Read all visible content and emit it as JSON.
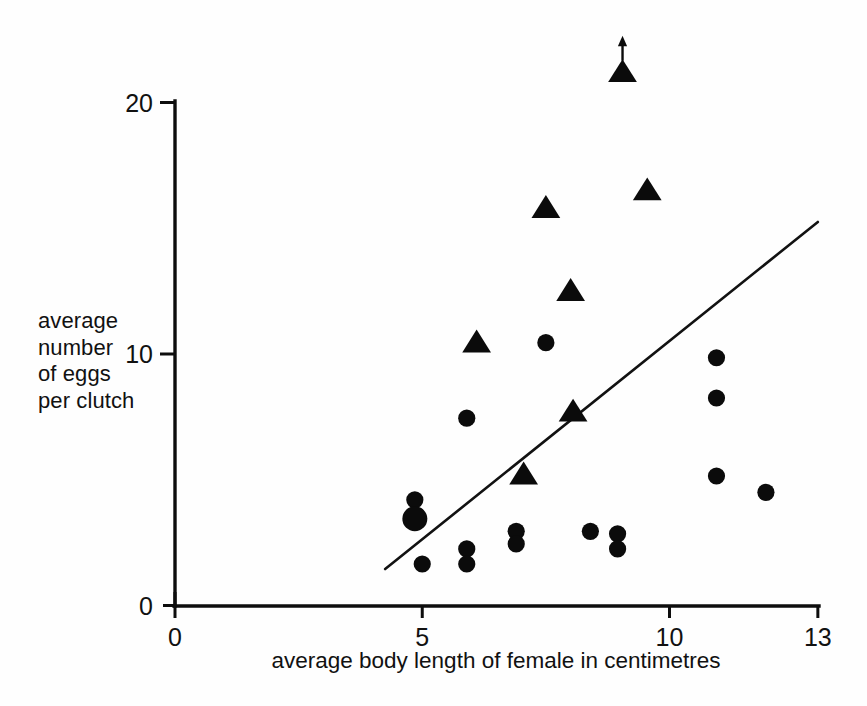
{
  "chart_data": {
    "type": "scatter",
    "title": "",
    "xlabel": "average body length of female in centimetres",
    "ylabel": "average number of eggs per clutch",
    "ylabel_lines": [
      "average",
      "number",
      "of eggs",
      "per clutch"
    ],
    "xlim": [
      0,
      13
    ],
    "ylim": [
      0,
      21.5
    ],
    "xticks": [
      0,
      5,
      10,
      13
    ],
    "xtick_labels": [
      "0",
      "5",
      "10",
      "13"
    ],
    "yticks": [
      0,
      10,
      20
    ],
    "ytick_labels": [
      "0",
      "10",
      "20"
    ],
    "grid": false,
    "legend": "none",
    "annotations": [
      {
        "name": "off-scale-arrow",
        "symbol": "up-arrow",
        "x": 9.05,
        "y": 22.1,
        "note": "upward arrow above highest triangle indicating value extends beyond axis"
      }
    ],
    "series": [
      {
        "name": "triangles",
        "marker": "triangle",
        "color": "#0b0b0b",
        "points": [
          {
            "x": 6.1,
            "y": 10.45
          },
          {
            "x": 7.5,
            "y": 15.8
          },
          {
            "x": 8.0,
            "y": 12.5
          },
          {
            "x": 8.05,
            "y": 7.7
          },
          {
            "x": 7.05,
            "y": 5.2
          },
          {
            "x": 9.05,
            "y": 21.2
          },
          {
            "x": 9.55,
            "y": 16.5
          }
        ]
      },
      {
        "name": "circles",
        "marker": "circle",
        "color": "#0b0b0b",
        "points": [
          {
            "x": 4.85,
            "y": 4.2,
            "size": "small"
          },
          {
            "x": 4.85,
            "y": 3.45,
            "size": "large"
          },
          {
            "x": 5.0,
            "y": 1.65,
            "size": "small"
          },
          {
            "x": 5.9,
            "y": 7.45,
            "size": "small"
          },
          {
            "x": 5.9,
            "y": 2.25,
            "size": "small"
          },
          {
            "x": 5.9,
            "y": 1.65,
            "size": "small"
          },
          {
            "x": 6.9,
            "y": 2.95,
            "size": "small"
          },
          {
            "x": 6.9,
            "y": 2.45,
            "size": "small"
          },
          {
            "x": 7.5,
            "y": 10.45,
            "size": "small"
          },
          {
            "x": 8.4,
            "y": 2.95,
            "size": "small"
          },
          {
            "x": 8.95,
            "y": 2.85,
            "size": "small"
          },
          {
            "x": 8.95,
            "y": 2.25,
            "size": "small"
          },
          {
            "x": 10.95,
            "y": 9.85,
            "size": "small"
          },
          {
            "x": 10.95,
            "y": 8.25,
            "size": "small"
          },
          {
            "x": 10.95,
            "y": 5.15,
            "size": "small"
          },
          {
            "x": 11.95,
            "y": 4.5,
            "size": "small"
          }
        ]
      }
    ],
    "trend_line": {
      "name": "regression-line",
      "x1": 4.25,
      "y1": 1.45,
      "x2": 13.0,
      "y2": 15.25
    }
  }
}
